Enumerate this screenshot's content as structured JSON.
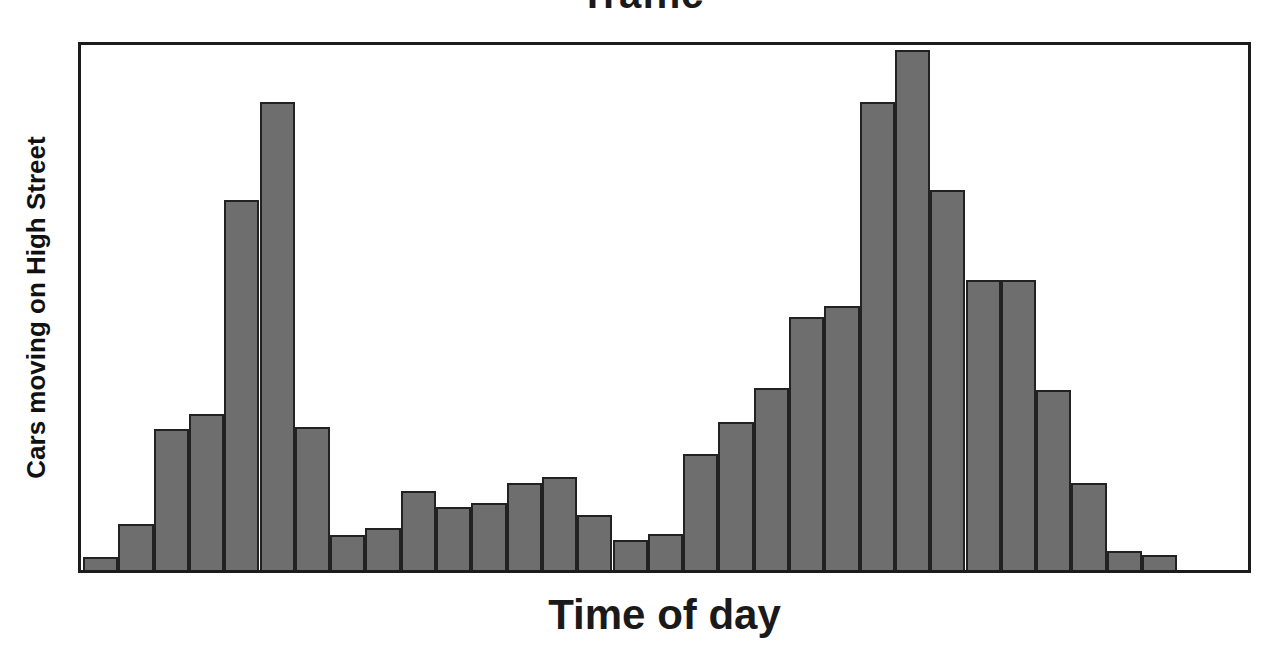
{
  "chart_data": {
    "type": "bar",
    "title": "Traffic",
    "xlabel": "Time of day",
    "ylabel": "Cars moving on High Street",
    "grid": false,
    "legend": null,
    "axis_tick_labels": {
      "x": [],
      "y": []
    },
    "xlim": [
      0,
      31
    ],
    "ylim": [
      0,
      500
    ],
    "note": "Histogram of traffic volume across the day: a sharp morning rush-hour peak, a low midday plateau, and a broader, higher evening rush-hour peak.",
    "categories": [
      "bin-01",
      "bin-02",
      "bin-03",
      "bin-04",
      "bin-05",
      "bin-06",
      "bin-07",
      "bin-08",
      "bin-09",
      "bin-10",
      "bin-11",
      "bin-12",
      "bin-13",
      "bin-14",
      "bin-15",
      "bin-16",
      "bin-17",
      "bin-18",
      "bin-19",
      "bin-20",
      "bin-21",
      "bin-22",
      "bin-23",
      "bin-24",
      "bin-25",
      "bin-26",
      "bin-27",
      "bin-28",
      "bin-29",
      "bin-30",
      "bin-31"
    ],
    "values": [
      12,
      44,
      134,
      148,
      350,
      443,
      135,
      33,
      40,
      75,
      60,
      63,
      82,
      88,
      52,
      28,
      34,
      110,
      140,
      172,
      240,
      250,
      443,
      492,
      360,
      275,
      275,
      170,
      82,
      18,
      14
    ]
  },
  "styles": {
    "bar_fill": "#6e6e6e",
    "bar_stroke": "#222222",
    "frame_stroke": "#1c1c1c",
    "text_color": "#1a1a1a",
    "background": "#ffffff"
  }
}
